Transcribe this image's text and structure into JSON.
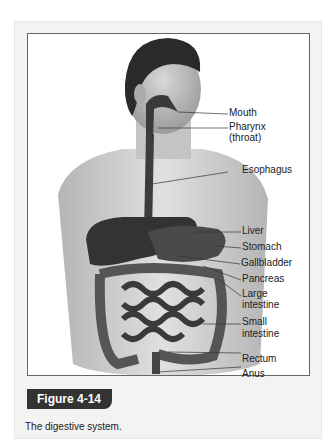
{
  "figure": {
    "number_label": "Figure 4-14",
    "caption": "The digestive system.",
    "labels": [
      {
        "text": "Mouth",
        "x": 229,
        "y": 112
      },
      {
        "text": "Pharynx",
        "x": 229,
        "y": 126
      },
      {
        "text": "(throat)",
        "x": 229,
        "y": 138
      },
      {
        "text": "Esophagus",
        "x": 229,
        "y": 170
      },
      {
        "text": "Liver",
        "x": 242,
        "y": 230
      },
      {
        "text": "Stomach",
        "x": 242,
        "y": 246
      },
      {
        "text": "Gallbladder",
        "x": 241,
        "y": 262
      },
      {
        "text": "Pancreas",
        "x": 242,
        "y": 278
      },
      {
        "text": "Large",
        "x": 242,
        "y": 293
      },
      {
        "text": "intestine",
        "x": 242,
        "y": 305
      },
      {
        "text": "Small",
        "x": 242,
        "y": 322
      },
      {
        "text": "intestine",
        "x": 242,
        "y": 334
      },
      {
        "text": "Rectum",
        "x": 242,
        "y": 352
      },
      {
        "text": "Anus",
        "x": 242,
        "y": 368
      }
    ]
  }
}
